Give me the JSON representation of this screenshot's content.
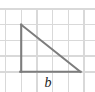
{
  "figure": {
    "kind": "right-triangle-on-grid",
    "background_color": "#ffffff",
    "grid": {
      "line_color": "#d9d9d9",
      "cell_size": 15.7,
      "origin_x": 5.5,
      "origin_y": 9.0,
      "columns": 5,
      "rows": 4,
      "x_positions": [
        5.5,
        21.2,
        36.9,
        52.6,
        68.3,
        84.0
      ],
      "y_positions": [
        9.0,
        24.7,
        40.4,
        56.1,
        71.8
      ],
      "visible": true
    },
    "triangle": {
      "stroke_color": "#7d7d7d",
      "stroke_width": 2.1,
      "fill": "none",
      "vertices": {
        "apex": {
          "x": 21.2,
          "y": 24.7
        },
        "right_angle": {
          "x": 21.2,
          "y": 71.8
        },
        "base_end": {
          "x": 80.5,
          "y": 71.8
        }
      },
      "right_angle_at": "bottom-left",
      "vertical_leg_cells": 3,
      "horizontal_leg_cells": 3.8
    },
    "labels": {
      "base": {
        "text": "b",
        "style": "italic-serif",
        "color": "#1a1a1a",
        "x": 48,
        "y": 87
      }
    }
  }
}
